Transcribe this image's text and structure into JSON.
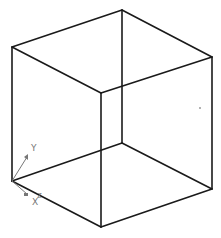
{
  "diagram": {
    "type": "wireframe-cube-isometric",
    "background": "#ffffff",
    "edge_color": "#1a1a1a",
    "vertices": {
      "top_back": [
        122,
        10
      ],
      "top_left": [
        12,
        47
      ],
      "top_right": [
        212,
        57
      ],
      "top_front": [
        101,
        93
      ],
      "bottom_back": [
        122,
        143
      ],
      "bottom_left": [
        12,
        181
      ],
      "bottom_right": [
        212,
        189
      ],
      "bottom_front": [
        101,
        227
      ]
    }
  },
  "ucs_icon": {
    "labels": {
      "y": "Y",
      "x": "X",
      "z": "Z"
    },
    "color": "#777777"
  },
  "marker": {
    "position": [
      200,
      108
    ]
  }
}
